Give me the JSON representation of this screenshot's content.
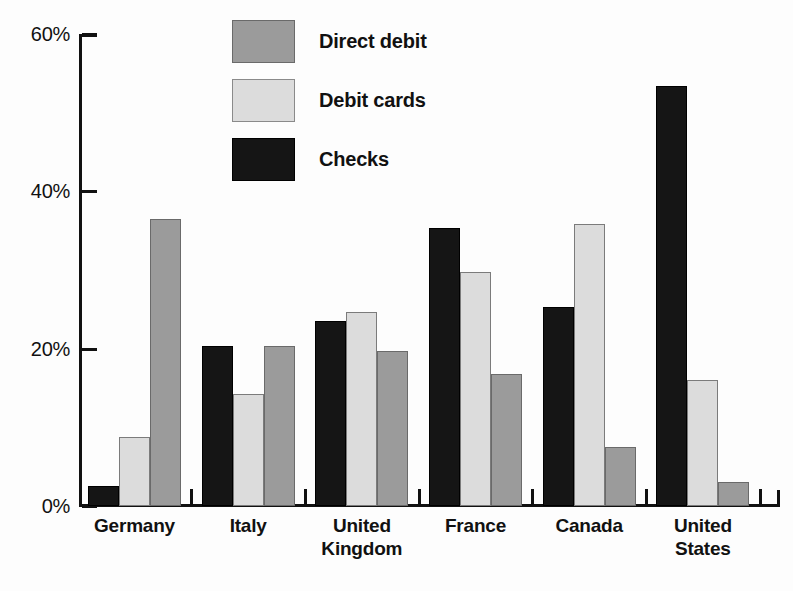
{
  "chart_data": {
    "type": "bar",
    "title": "",
    "subtitle": "",
    "xlabel": "",
    "ylabel": "",
    "ylim": [
      0,
      60
    ],
    "y_ticks": [
      0,
      20,
      40,
      60
    ],
    "y_tick_labels": [
      "0%",
      "20%",
      "40%",
      "60%"
    ],
    "grid": false,
    "legend_position": "top-center",
    "value_unit": "%",
    "categories": [
      "Germany",
      "Italy",
      "United Kingdom",
      "France",
      "Canada",
      "United States"
    ],
    "category_label_lines": [
      [
        "Germany"
      ],
      [
        "Italy"
      ],
      [
        "United",
        "Kingdom"
      ],
      [
        "France"
      ],
      [
        "Canada"
      ],
      [
        "United",
        "States"
      ]
    ],
    "series_draw_order": [
      "Checks",
      "Debit cards",
      "Direct debit"
    ],
    "series": [
      {
        "name": "Direct debit",
        "color": "#9b9b9b",
        "values": [
          36.5,
          20.4,
          19.7,
          16.8,
          7.5,
          3.0
        ]
      },
      {
        "name": "Debit cards",
        "color": "#dcdcdc",
        "values": [
          8.8,
          14.2,
          24.7,
          29.8,
          35.8,
          16.0
        ]
      },
      {
        "name": "Checks",
        "color": "#151515",
        "values": [
          2.5,
          20.3,
          23.5,
          35.4,
          25.3,
          53.4
        ]
      }
    ]
  },
  "legend": {
    "items": [
      {
        "label": "Direct debit",
        "swatch": "directdebit"
      },
      {
        "label": "Debit cards",
        "swatch": "debitcards"
      },
      {
        "label": "Checks",
        "swatch": "checks"
      }
    ]
  },
  "axis": {
    "y_labels": [
      "60%",
      "40%",
      "20%",
      "0%"
    ]
  }
}
